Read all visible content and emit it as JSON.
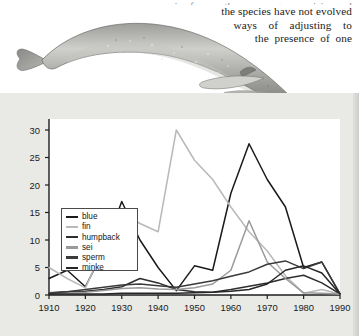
{
  "page": {
    "body_text_lines": [
      "species face as the oceans grow noisier and",
      "the species have not evolved",
      "ways    of    adjusting    to",
      "the  presence  of  one"
    ],
    "illustration_name": "blue-whale-illustration"
  },
  "chart_data": {
    "type": "line",
    "title": "",
    "xlabel": "Year",
    "ylabel": "Number of Whales Caught (in thousands)",
    "xlim": [
      1910,
      1990
    ],
    "ylim": [
      0,
      32
    ],
    "xticks": [
      1910,
      1920,
      1930,
      1940,
      1950,
      1960,
      1970,
      1980,
      1990
    ],
    "yticks": [
      0,
      5,
      10,
      15,
      20,
      25,
      30
    ],
    "grid": false,
    "legend_position": "upper-left",
    "x": [
      1910,
      1915,
      1920,
      1925,
      1930,
      1935,
      1940,
      1945,
      1950,
      1955,
      1960,
      1965,
      1970,
      1975,
      1980,
      1985,
      1990
    ],
    "series": [
      {
        "name": "blue",
        "color": "#1a1a1a",
        "values": [
          3.0,
          4.5,
          1.5,
          8.0,
          17.0,
          10.0,
          5.0,
          0.8,
          5.3,
          4.5,
          18.5,
          27.5,
          21.0,
          16.0,
          5.0,
          6.0,
          0.2
        ]
      },
      {
        "name": "fin",
        "color": "#b9b9b9",
        "values": [
          5.0,
          3.0,
          1.3,
          8.5,
          15.0,
          13.0,
          11.5,
          30.0,
          24.5,
          21.0,
          16.0,
          11.5,
          8.0,
          3.5,
          0.3,
          1.0,
          0.2
        ]
      },
      {
        "name": "humpback",
        "color": "#2e2e2e",
        "values": [
          0.4,
          0.6,
          0.7,
          1.0,
          1.5,
          3.0,
          2.2,
          1.0,
          0.6,
          0.5,
          1.0,
          1.6,
          2.2,
          3.0,
          3.6,
          2.2,
          0.2
        ]
      },
      {
        "name": "sei",
        "color": "#9a9a9a",
        "values": [
          0.3,
          0.4,
          0.5,
          0.8,
          1.2,
          1.3,
          1.1,
          1.0,
          1.3,
          2.0,
          4.5,
          13.5,
          6.0,
          3.0,
          0.4,
          0.3,
          0.2
        ]
      },
      {
        "name": "sperm",
        "color": "#3a3a3a",
        "values": [
          0.3,
          0.6,
          1.0,
          1.4,
          1.8,
          2.0,
          1.7,
          1.4,
          2.0,
          2.6,
          3.4,
          4.2,
          5.6,
          6.2,
          4.8,
          6.0,
          0.2
        ]
      },
      {
        "name": "minke",
        "color": "#262626",
        "values": [
          0.2,
          0.2,
          0.2,
          0.2,
          0.3,
          0.3,
          0.3,
          0.3,
          0.4,
          0.5,
          0.7,
          1.0,
          2.0,
          4.5,
          5.3,
          4.0,
          0.2
        ]
      }
    ]
  }
}
